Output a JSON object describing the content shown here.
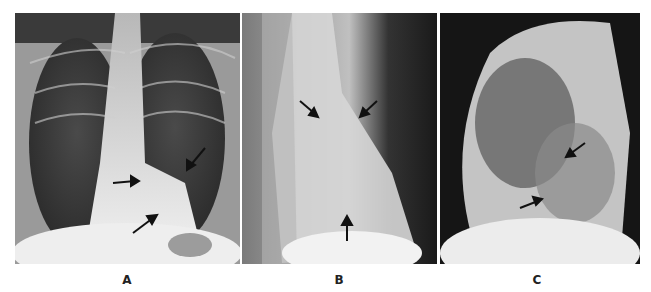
{
  "figure": {
    "panels": [
      {
        "id": "A",
        "label": "A",
        "view": "frontal chest radiograph (PA)",
        "arrow_count": 3
      },
      {
        "id": "B",
        "label": "B",
        "view": "oblique chest radiograph",
        "arrow_count": 3
      },
      {
        "id": "C",
        "label": "C",
        "view": "lateral chest radiograph",
        "arrow_count": 2
      }
    ]
  },
  "colors": {
    "background": "#ffffff",
    "arrow": "#111111",
    "label": "#222222"
  }
}
